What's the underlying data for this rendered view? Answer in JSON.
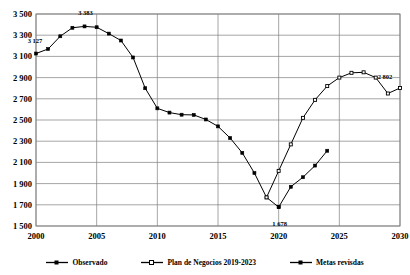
{
  "chart_data": {
    "type": "line",
    "title": "",
    "xlabel": "",
    "ylabel": "",
    "xlim": [
      2000,
      2030
    ],
    "ylim": [
      1500,
      3500
    ],
    "ytick_step": 200,
    "xtick_step": 5,
    "grid": true,
    "legend_position": "bottom",
    "yticks": [
      "3 500",
      "3 300",
      "3 100",
      "2 900",
      "2 700",
      "2 500",
      "2 300",
      "2 100",
      "1 900",
      "1 700",
      "1 500"
    ],
    "ytick_values": [
      3500,
      3300,
      3100,
      2900,
      2700,
      2500,
      2300,
      2100,
      1900,
      1700,
      1500
    ],
    "xticks": [
      "2000",
      "2005",
      "2010",
      "2015",
      "2020",
      "2025",
      "2030"
    ],
    "xtick_values": [
      2000,
      2005,
      2010,
      2015,
      2020,
      2025,
      2030
    ],
    "series": [
      {
        "name": "Observado",
        "marker": "filled-square",
        "x": [
          2000,
          2001,
          2002,
          2003,
          2004,
          2005,
          2006,
          2007,
          2008,
          2009,
          2010,
          2011,
          2012,
          2013,
          2014,
          2015,
          2016,
          2017,
          2018,
          2019,
          2020
        ],
        "values": [
          3127,
          3170,
          3290,
          3370,
          3383,
          3375,
          3315,
          3250,
          3090,
          2800,
          2610,
          2570,
          2550,
          2548,
          2505,
          2440,
          2330,
          2190,
          2000,
          1770,
          1678
        ]
      },
      {
        "name": "Plan de Negocios 2019-2023",
        "marker": "open-square",
        "x": [
          2019,
          2020,
          2021,
          2022,
          2023,
          2024,
          2025,
          2026,
          2027,
          2028,
          2029,
          2030
        ],
        "values": [
          1770,
          2020,
          2270,
          2520,
          2690,
          2820,
          2900,
          2945,
          2950,
          2900,
          2750,
          2802
        ]
      },
      {
        "name": "Metas revisdas",
        "marker": "filled-square",
        "x": [
          2020,
          2021,
          2022,
          2023,
          2024
        ],
        "values": [
          1678,
          1870,
          1960,
          2070,
          2210
        ]
      }
    ],
    "annotations": [
      {
        "text": "3 127",
        "x": 2000,
        "y": 3127,
        "dx": -2,
        "dy": -13
      },
      {
        "text": "3 383",
        "x": 2004,
        "y": 3383,
        "dx": 0,
        "dy": -13
      },
      {
        "text": "1 678",
        "x": 2020,
        "y": 1678,
        "dx": 0,
        "dy": 17
      },
      {
        "text": "2 802",
        "x": 2030,
        "y": 2802,
        "dx": -16,
        "dy": -11
      }
    ],
    "colors": {
      "line": "#000000",
      "grid": "#808080",
      "axis": "#808080",
      "background": "#ffffff"
    }
  },
  "legend": {
    "items": [
      {
        "label": "Observado",
        "marker": "filled-square"
      },
      {
        "label": "Plan de Negocios 2019-2023",
        "marker": "open-square"
      },
      {
        "label": "Metas revisdas",
        "marker": "filled-square"
      }
    ]
  }
}
